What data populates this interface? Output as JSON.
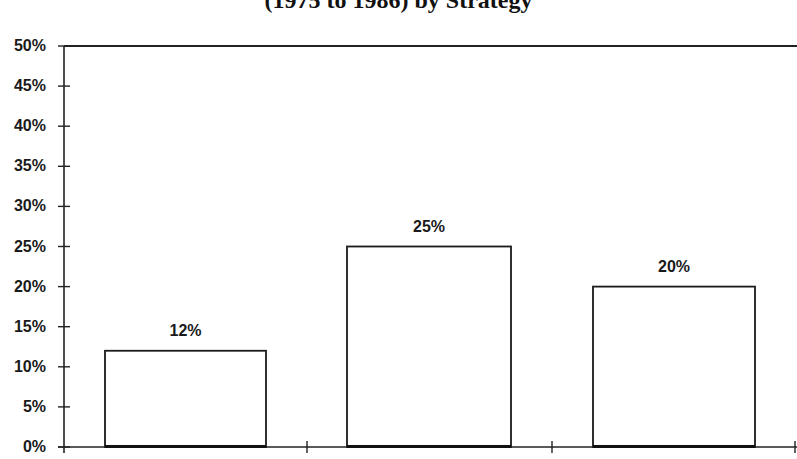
{
  "chart_data": {
    "type": "bar",
    "title": "(1975 to 1986) by Strategy",
    "title_partially_visible": true,
    "categories": [
      "",
      "",
      ""
    ],
    "values": [
      12,
      25,
      20
    ],
    "value_labels": [
      "12%",
      "25%",
      "20%"
    ],
    "xlabel": "",
    "ylabel": "",
    "ylim": [
      0,
      50
    ],
    "yticks": [
      0,
      5,
      10,
      15,
      20,
      25,
      30,
      35,
      40,
      45,
      50
    ],
    "ytick_labels": [
      "0%",
      "5%",
      "10%",
      "15%",
      "20%",
      "25%",
      "30%",
      "35%",
      "40%",
      "45%",
      "50%"
    ],
    "grid": false,
    "legend": null,
    "bar_fill": "#ffffff",
    "bar_stroke": "#1a1a1a"
  },
  "geometry": {
    "axis_x": 64,
    "y0": 447,
    "y50": 46,
    "bars": [
      {
        "x": 105,
        "w": 161
      },
      {
        "x": 347,
        "w": 164
      },
      {
        "x": 593,
        "w": 162
      }
    ],
    "xticks": [
      307,
      552,
      795
    ]
  }
}
